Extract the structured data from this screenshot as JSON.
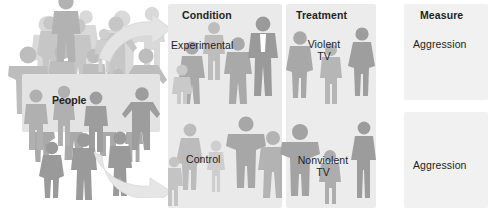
{
  "diagram": {
    "title_not_shown": "",
    "groups": {
      "people": {
        "label": "People"
      },
      "condition": {
        "heading": "Condition",
        "levels": [
          {
            "label": "Experimental"
          },
          {
            "label": "Control"
          }
        ]
      },
      "treatment": {
        "heading": "Treatment",
        "levels": [
          {
            "label": "Violent\nTV"
          },
          {
            "label": "Nonviolent\nTV"
          }
        ]
      },
      "measure": {
        "heading": "Measure",
        "levels": [
          {
            "label": "Aggression"
          },
          {
            "label": "Aggression"
          }
        ]
      }
    },
    "arrows": [
      {
        "name": "arrow-to-experimental",
        "direction": "curve-up-right"
      },
      {
        "name": "arrow-to-control",
        "direction": "curve-down-right"
      }
    ],
    "colors": {
      "background": "#ffffff",
      "panel": "#ececec",
      "panel_condition": "#eaeaeb",
      "panel_measure": "#f1f1f1",
      "people_box": "#e3e3e4",
      "text": "#231f20",
      "figure_dark": "#9a9a9a",
      "figure_mid": "#b4b4b4",
      "figure_light": "#cfcfcf",
      "figure_pale": "#dedede",
      "arrow_fill": "#e2e2e2",
      "arrow_stroke": "#d2d2d2"
    }
  }
}
